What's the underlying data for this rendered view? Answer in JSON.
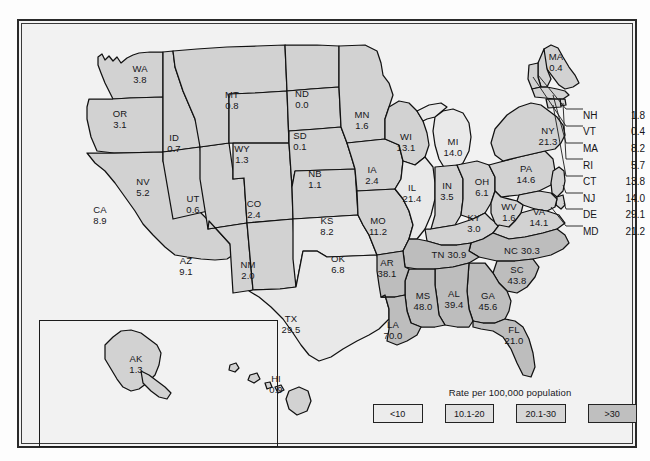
{
  "figure": {
    "title": "Rate per 100,000 population",
    "accent_shade": "#d2d2d2",
    "outline_color": "#111111",
    "background": "#f2f2f2"
  },
  "legend": {
    "title": "Rate per 100,000 population",
    "bins": [
      {
        "label": "<10",
        "color": "#ececec"
      },
      {
        "label": "10.1-20",
        "color": "#e0e0e0"
      },
      {
        "label": "20.1-30",
        "color": "#d6d6d6"
      },
      {
        "label": ">30",
        "color": "#bfbfbf"
      }
    ]
  },
  "callouts": [
    {
      "abbr": "NH",
      "value": "1.8"
    },
    {
      "abbr": "VT",
      "value": "0.4"
    },
    {
      "abbr": "MA",
      "value": "8.2"
    },
    {
      "abbr": "RI",
      "value": "5.7"
    },
    {
      "abbr": "CT",
      "value": "13.8"
    },
    {
      "abbr": "NJ",
      "value": "14.0"
    },
    {
      "abbr": "DE",
      "value": "29.1"
    },
    {
      "abbr": "MD",
      "value": "21.2"
    }
  ],
  "map_labels": [
    {
      "abbr": "WA",
      "value": "3.8",
      "x": 123,
      "y": 55,
      "inline": false
    },
    {
      "abbr": "OR",
      "value": "3.1",
      "x": 103,
      "y": 100,
      "inline": false
    },
    {
      "abbr": "ID",
      "value": "0.7",
      "x": 157,
      "y": 124,
      "inline": false
    },
    {
      "abbr": "MT",
      "value": "0.8",
      "x": 215,
      "y": 81,
      "inline": false
    },
    {
      "abbr": "ND",
      "value": "0.0",
      "x": 285,
      "y": 80,
      "inline": false
    },
    {
      "abbr": "SD",
      "value": "0.1",
      "x": 283,
      "y": 122,
      "inline": false
    },
    {
      "abbr": "WY",
      "value": "1.3",
      "x": 225,
      "y": 135,
      "inline": false
    },
    {
      "abbr": "NB",
      "value": "1.1",
      "x": 298,
      "y": 160,
      "inline": false
    },
    {
      "abbr": "NV",
      "value": "5.2",
      "x": 126,
      "y": 168,
      "inline": false
    },
    {
      "abbr": "UT",
      "value": "0.6",
      "x": 176,
      "y": 185,
      "inline": false
    },
    {
      "abbr": "CA",
      "value": "8.9",
      "x": 83,
      "y": 196,
      "inline": false
    },
    {
      "abbr": "CO",
      "value": "2.4",
      "x": 237,
      "y": 190,
      "inline": false
    },
    {
      "abbr": "KS",
      "value": "8.2",
      "x": 310,
      "y": 207,
      "inline": false
    },
    {
      "abbr": "MN",
      "value": "1.6",
      "x": 345,
      "y": 101,
      "inline": false
    },
    {
      "abbr": "WI",
      "value": "13.1",
      "x": 389,
      "y": 123,
      "inline": false
    },
    {
      "abbr": "IA",
      "value": "2.4",
      "x": 355,
      "y": 156,
      "inline": false
    },
    {
      "abbr": "MO",
      "value": "11.2",
      "x": 361,
      "y": 207,
      "inline": false
    },
    {
      "abbr": "IL",
      "value": "21.4",
      "x": 395,
      "y": 174,
      "inline": false
    },
    {
      "abbr": "MI",
      "value": "14.0",
      "x": 436,
      "y": 128,
      "inline": false
    },
    {
      "abbr": "IN",
      "value": "3.5",
      "x": 430,
      "y": 172,
      "inline": false
    },
    {
      "abbr": "OH",
      "value": "6.1",
      "x": 465,
      "y": 168,
      "inline": false
    },
    {
      "abbr": "KY",
      "value": "3.0",
      "x": 457,
      "y": 204,
      "inline": false
    },
    {
      "abbr": "WV",
      "value": "1.6",
      "x": 492,
      "y": 193,
      "inline": false
    },
    {
      "abbr": "VA",
      "value": "14.1",
      "x": 522,
      "y": 198,
      "inline": false
    },
    {
      "abbr": "PA",
      "value": "14.6",
      "x": 509,
      "y": 155,
      "inline": false
    },
    {
      "abbr": "NY",
      "value": "21.3",
      "x": 531,
      "y": 117,
      "inline": false
    },
    {
      "abbr": "MA",
      "value": "0.4",
      "x": 539,
      "y": 43,
      "inline": false
    },
    {
      "abbr": "AZ",
      "value": "9.1",
      "x": 169,
      "y": 247,
      "inline": false
    },
    {
      "abbr": "NM",
      "value": "2.0",
      "x": 231,
      "y": 251,
      "inline": false
    },
    {
      "abbr": "OK",
      "value": "6.8",
      "x": 321,
      "y": 245,
      "inline": false
    },
    {
      "abbr": "TX",
      "value": "29.5",
      "x": 274,
      "y": 305,
      "inline": false
    },
    {
      "abbr": "AR",
      "value": "38.1",
      "x": 370,
      "y": 249,
      "inline": false
    },
    {
      "abbr": "LA",
      "value": "70.0",
      "x": 376,
      "y": 311,
      "inline": false
    },
    {
      "abbr": "MS",
      "value": "48.0",
      "x": 406,
      "y": 282,
      "inline": false
    },
    {
      "abbr": "AL",
      "value": "39.4",
      "x": 437,
      "y": 280,
      "inline": false
    },
    {
      "abbr": "GA",
      "value": "45.6",
      "x": 471,
      "y": 282,
      "inline": false
    },
    {
      "abbr": "SC",
      "value": "43.8",
      "x": 500,
      "y": 256,
      "inline": false
    },
    {
      "abbr": "FL",
      "value": "21.0",
      "x": 497,
      "y": 316,
      "inline": false
    },
    {
      "abbr": "TN",
      "value": "30.9",
      "x": 432,
      "y": 236,
      "inline": true
    },
    {
      "abbr": "NC",
      "value": "30.3",
      "x": 505,
      "y": 232,
      "inline": true
    },
    {
      "abbr": "AK",
      "value": "1.3",
      "x": 119,
      "y": 345,
      "inline": false
    },
    {
      "abbr": "HI",
      "value": "0.9",
      "x": 259,
      "y": 365,
      "inline": false
    }
  ],
  "chart_data": {
    "type": "map",
    "title": "Rate per 100,000 population",
    "unit": "rate per 100,000 population",
    "bins": [
      "<10",
      "10.1-20",
      "20.1-30",
      ">30"
    ],
    "values": {
      "AL": 39.4,
      "AK": 1.3,
      "AZ": 9.1,
      "AR": 38.1,
      "CA": 8.9,
      "CO": 2.4,
      "CT": 13.8,
      "DE": 29.1,
      "FL": 21.0,
      "GA": 45.6,
      "HI": 0.9,
      "ID": 0.7,
      "IL": 21.4,
      "IN": 3.5,
      "IA": 2.4,
      "KS": 8.2,
      "KY": 3.0,
      "LA": 70.0,
      "MA": 0.4,
      "MD": 21.2,
      "MA_state": 8.2,
      "MI": 14.0,
      "MN": 1.6,
      "MS": 48.0,
      "MO": 11.2,
      "MT": 0.8,
      "NB": 1.1,
      "NV": 5.2,
      "NH": 1.8,
      "NJ": 14.0,
      "NM": 2.0,
      "NY": 21.3,
      "NC": 30.3,
      "ND": 0.0,
      "OH": 6.1,
      "OK": 6.8,
      "OR": 3.1,
      "PA": 14.6,
      "RI": 5.7,
      "SC": 43.8,
      "SD": 0.1,
      "TN": 30.9,
      "TX": 29.5,
      "UT": 0.6,
      "VT": 0.4,
      "VA": 14.1,
      "WA": 3.8,
      "WV": 1.6,
      "WI": 13.1,
      "WY": 1.3
    }
  }
}
